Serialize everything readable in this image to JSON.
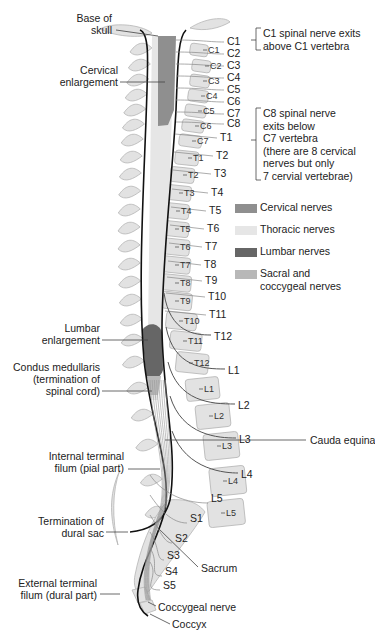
{
  "figure": {
    "left_labels": {
      "base_of_skull": [
        "Base of",
        "skull"
      ],
      "cervical_enlargement": [
        "Cervical",
        "enlargement"
      ],
      "lumbar_enlargement": [
        "Lumbar",
        "enlargement"
      ],
      "conus": [
        "Condus medullaris",
        "(termination of",
        "spinal cord)"
      ],
      "internal_filum": [
        "Internal terminal",
        "filum (pial part)"
      ],
      "dural_sac": [
        "Termination of",
        "dural sac"
      ],
      "external_filum": [
        "External terminal",
        "filum (dural part)"
      ]
    },
    "vertebra_labels": [
      "C1",
      "C2",
      "C3",
      "C4",
      "C5",
      "C6",
      "C7",
      "T1",
      "T2",
      "T3",
      "T4",
      "T5",
      "T6",
      "T7",
      "T8",
      "T9",
      "T10",
      "T11",
      "T12",
      "L1",
      "L2",
      "L3",
      "L4",
      "L5"
    ],
    "nerve_labels": [
      "C1",
      "C2",
      "C3",
      "C4",
      "C5",
      "C6",
      "C7",
      "C8",
      "T1",
      "T2",
      "T3",
      "T4",
      "T5",
      "T6",
      "T7",
      "T8",
      "T9",
      "T10",
      "T11",
      "T12",
      "L1",
      "L2",
      "L3",
      "L4",
      "L5",
      "S1",
      "S2",
      "S3",
      "S4",
      "S5"
    ],
    "right_labels": {
      "cauda_equina": "Cauda equina",
      "sacrum": "Sacrum",
      "coccygeal_nerve": "Coccygeal nerve",
      "coccyx": "Coccyx"
    },
    "notes": {
      "c1": [
        "C1 spinal nerve exits",
        "above C1 vertebra"
      ],
      "c8": [
        "C8 spinal nerve",
        "exits below",
        "C7 vertebra",
        "(there are 8 cervical",
        "nerves but only",
        "7 cervial vertebrae)"
      ]
    },
    "legend": [
      {
        "label": [
          "Cervical nerves"
        ],
        "color": "#8f8f8f"
      },
      {
        "label": [
          "Thoracic nerves"
        ],
        "color": "#e6e6e6"
      },
      {
        "label": [
          "Lumbar nerves"
        ],
        "color": "#666666"
      },
      {
        "label": [
          "Sacral and",
          "coccygeal nerves"
        ],
        "color": "#b8b8b8"
      }
    ],
    "colors": {
      "bone_fill": "#e2e2e2",
      "bone_stroke": "#b5b5b5",
      "dura": "#111111",
      "cervical": "#8f8f8f",
      "lumbar": "#666666",
      "thoracic": "#e6e6e6",
      "sacral": "#b8b8b8",
      "leader": "#444444"
    }
  }
}
